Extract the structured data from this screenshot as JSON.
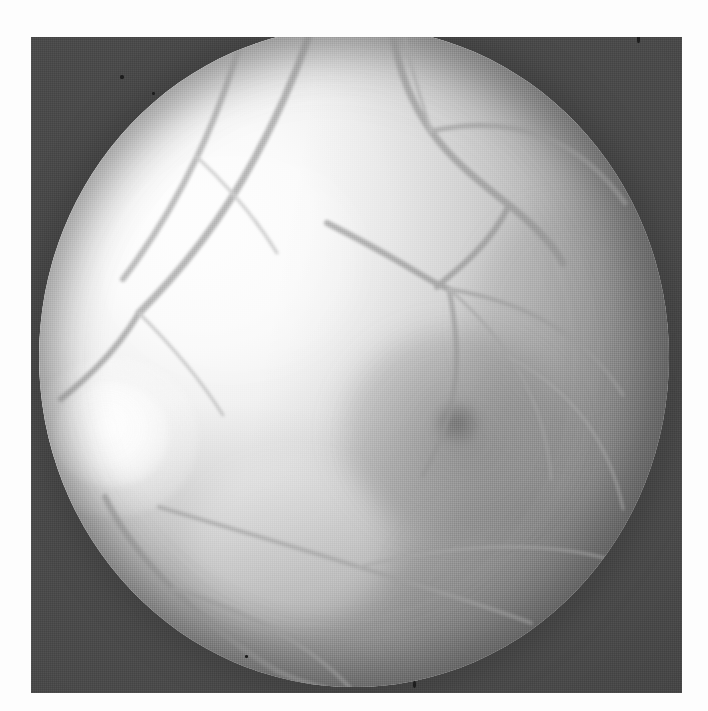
{
  "image": {
    "kind": "retinal-fundus-photograph",
    "modality": "red-free / black-and-white fundus photograph",
    "caption": "",
    "width_px": 708,
    "height_px": 711,
    "colors": {
      "page_background": "#fdfdfd",
      "print_border": "#4a4a4a",
      "retina_bright": "#fdfdfd",
      "retina_mid": "#cfcfcf",
      "retina_dark": "#9d9d9d",
      "vessel": "#8a8a8a",
      "macula": "#6e6e6e"
    },
    "print_frame": {
      "left": 31,
      "top": 37,
      "width": 651,
      "height": 656
    },
    "fundus_circle": {
      "cx": 323,
      "cy": 320,
      "rx": 315,
      "ry": 330
    }
  },
  "features": {
    "optic_disc": {
      "label": "optic disc",
      "cx": 100,
      "cy": 435,
      "rx": 58,
      "ry": 52,
      "note": "bright pale oval at the nasal (left) margin of the field"
    },
    "macula": {
      "label": "macula",
      "cx": 425,
      "cy": 410,
      "rx": 115,
      "ry": 105,
      "note": "diffuse darker zone temporal to the disc"
    },
    "fovea": {
      "label": "fovea",
      "cx": 418,
      "cy": 396,
      "rx": 22,
      "ry": 20,
      "note": "small dark central reflex spot"
    },
    "illumination": {
      "brightest_quadrant": "upper-left",
      "darkest_quadrant": "lower-right"
    }
  },
  "chart_data": {
    "type": "scatter",
    "xlabel": "",
    "ylabel": "",
    "vessels": [
      {
        "name": "superior-temporal arcade trunk",
        "stroke": "#909090",
        "width": 7,
        "d": "M 352 -8 C 356 30, 368 70, 392 104 C 416 138, 448 160, 470 178 C 492 196, 512 214, 524 236"
      },
      {
        "name": "superior-temporal arcade upper branch",
        "stroke": "#9a9a9a",
        "width": 5,
        "d": "M 392 104 C 430 96, 470 96, 506 110 C 540 124, 566 148, 586 176"
      },
      {
        "name": "superior arcade to junction",
        "stroke": "#8f8f8f",
        "width": 6,
        "d": "M 470 178 C 462 196, 450 212, 434 228 C 418 244, 406 252, 398 260"
      },
      {
        "name": "central junction inflow",
        "stroke": "#8c8c8c",
        "width": 6,
        "d": "M 288 196 C 320 212, 356 232, 386 250 C 398 257, 404 260, 410 262"
      },
      {
        "name": "junction outflow inferior",
        "stroke": "#959595",
        "width": 5,
        "d": "M 410 262 C 416 292, 420 324, 416 356 C 412 390, 400 420, 384 448"
      },
      {
        "name": "junction outflow temporal",
        "stroke": "#9b9b9b",
        "width": 4,
        "d": "M 410 262 C 446 268, 484 280, 516 300 C 546 318, 568 342, 584 368"
      },
      {
        "name": "junction outflow fine temporal",
        "stroke": "#a3a3a3",
        "width": 3,
        "d": "M 410 262 C 440 288, 468 320, 486 356 C 502 388, 510 420, 512 452"
      },
      {
        "name": "nasal arcade upper",
        "stroke": "#969696",
        "width": 6,
        "d": "M 208 -8 C 196 36, 180 84, 158 130 C 136 176, 110 218, 84 252"
      },
      {
        "name": "nasal arcade lower",
        "stroke": "#8d8d8d",
        "width": 7,
        "d": "M 274 -4 C 258 46, 234 100, 204 152 C 174 204, 136 250, 100 286"
      },
      {
        "name": "nasal branch to disc",
        "stroke": "#8a8a8a",
        "width": 6,
        "d": "M 100 286 C 88 306, 74 324, 58 340 C 44 354, 32 364, 22 372"
      },
      {
        "name": "disc inferior vessel",
        "stroke": "#8f8f8f",
        "width": 6,
        "d": "M 66 470 C 80 500, 104 532, 134 562 C 166 594, 202 622, 238 644"
      },
      {
        "name": "disc inferior vessel branch",
        "stroke": "#9c9c9c",
        "width": 4,
        "d": "M 134 562 C 168 572, 206 586, 240 606 C 272 624, 296 644, 314 664"
      },
      {
        "name": "inferior temporal arcade",
        "stroke": "#9f9f9f",
        "width": 4,
        "d": "M 120 480 C 180 498, 250 518, 320 540 C 386 560, 444 578, 492 596"
      },
      {
        "name": "inferior temporal fine branch",
        "stroke": "#a6a6a6",
        "width": 3,
        "d": "M 320 540 C 368 528, 420 520, 470 520 C 516 520, 556 526, 588 538"
      },
      {
        "name": "temporal fine arc",
        "stroke": "#a8a8a8",
        "width": 3,
        "d": "M 470 330 C 500 346, 528 368, 548 396 C 566 422, 578 452, 584 482"
      },
      {
        "name": "superior fine twig",
        "stroke": "#a4a4a4",
        "width": 3,
        "d": "M 392 104 C 382 72, 372 42, 366 12"
      },
      {
        "name": "upper-left faint twig",
        "stroke": "#b0b0b0",
        "width": 3,
        "d": "M 158 130 C 188 158, 216 190, 238 226"
      },
      {
        "name": "lower nasal faint twig",
        "stroke": "#ababab",
        "width": 3,
        "d": "M 100 286 C 130 316, 160 350, 184 388"
      },
      {
        "name": "bottom exit vessel",
        "stroke": "#949494",
        "width": 5,
        "d": "M 238 644 C 264 656, 292 664, 320 668"
      }
    ],
    "specks": [
      {
        "x": 353,
        "y": 18,
        "w": 4,
        "h": 4
      },
      {
        "x": 381,
        "y": 26,
        "w": 3,
        "h": 5
      },
      {
        "x": 120,
        "y": 75,
        "w": 4,
        "h": 4
      },
      {
        "x": 152,
        "y": 92,
        "w": 3,
        "h": 3
      },
      {
        "x": 637,
        "y": 34,
        "w": 3,
        "h": 9
      },
      {
        "x": 413,
        "y": 681,
        "w": 3,
        "h": 7
      },
      {
        "x": 245,
        "y": 655,
        "w": 3,
        "h": 3
      }
    ]
  }
}
